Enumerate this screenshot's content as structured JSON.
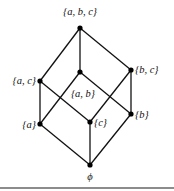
{
  "diagram": {
    "type": "hasse-diagram",
    "nodes": [
      {
        "id": "abc",
        "label": "{a, b, c}",
        "x": 80,
        "y": 28,
        "lx": 80,
        "ly": 15,
        "anchor": "middle"
      },
      {
        "id": "ac",
        "label": "{a, c}",
        "x": 40,
        "y": 81,
        "lx": 36,
        "ly": 84,
        "anchor": "end"
      },
      {
        "id": "ab",
        "label": "{a, b}",
        "x": 80,
        "y": 72,
        "lx": 83,
        "ly": 97,
        "anchor": "middle"
      },
      {
        "id": "bc",
        "label": "{b, c}",
        "x": 131,
        "y": 70,
        "lx": 135,
        "ly": 73,
        "anchor": "start"
      },
      {
        "id": "a",
        "label": "{a}",
        "x": 40,
        "y": 124,
        "lx": 36,
        "ly": 128,
        "anchor": "end"
      },
      {
        "id": "c",
        "label": "{c}",
        "x": 90,
        "y": 122,
        "lx": 94,
        "ly": 126,
        "anchor": "start"
      },
      {
        "id": "b",
        "label": "{b}",
        "x": 131,
        "y": 114,
        "lx": 135,
        "ly": 118,
        "anchor": "start"
      },
      {
        "id": "empty",
        "label": "ϕ",
        "x": 90,
        "y": 165,
        "lx": 90,
        "ly": 180,
        "anchor": "middle"
      }
    ],
    "edges": [
      [
        "abc",
        "ac"
      ],
      [
        "abc",
        "ab"
      ],
      [
        "abc",
        "bc"
      ],
      [
        "ac",
        "a"
      ],
      [
        "ac",
        "c"
      ],
      [
        "ab",
        "a"
      ],
      [
        "ab",
        "b"
      ],
      [
        "bc",
        "c"
      ],
      [
        "bc",
        "b"
      ],
      [
        "a",
        "empty"
      ],
      [
        "c",
        "empty"
      ],
      [
        "b",
        "empty"
      ]
    ]
  }
}
